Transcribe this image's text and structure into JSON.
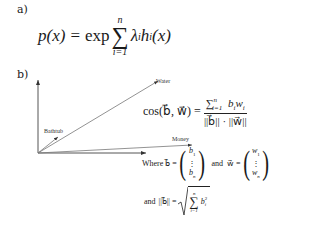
{
  "part_a": {
    "label": "a)",
    "formula": {
      "lhs": "p(x)",
      "equals": "=",
      "exp": "exp",
      "sum_symbol": "∑",
      "sum_upper": "n",
      "sum_lower": "i=1",
      "term": "λ",
      "term_sub": "i",
      "term2": "h",
      "term2_sub": "i",
      "term2_arg": "(x)"
    }
  },
  "part_b": {
    "label": "b)",
    "vectors": [
      {
        "name": "Water",
        "label": "Water"
      },
      {
        "name": "Bathtub",
        "label": "Bathtub"
      },
      {
        "name": "Money",
        "label": "Money"
      }
    ],
    "cosine_formula": {
      "lhs": "cos(b⃗, w⃗) =",
      "numerator": "∑",
      "num_upper": "n",
      "num_lower": "i=1",
      "num_term": "b",
      "num_term_sub": "i",
      "num_term2": "w",
      "num_term2_sub": "i",
      "denominator": "||b⃗|| · ||w⃗||"
    },
    "where_line": {
      "where": "Where",
      "b_def": "b⃗ =",
      "b_top": "b",
      "b_top_sub": "1",
      "b_dots": "⋮",
      "b_bottom": "b",
      "b_bottom_sub": "n",
      "and": "and",
      "w_def": "w⃗ =",
      "w_top": "w",
      "w_top_sub": "1",
      "w_dots": "⋮",
      "w_bottom": "w",
      "w_bottom_sub": "n"
    },
    "norm_line": {
      "and": "and",
      "lhs": "||b⃗|| =",
      "sum_symbol": "∑",
      "sum_upper": "n",
      "sum_lower": "i=1",
      "term": "b",
      "term_sub": "i",
      "term_sup": "2"
    }
  }
}
